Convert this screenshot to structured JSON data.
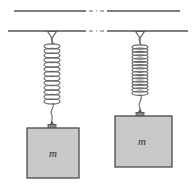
{
  "figure": {
    "background_color": "#ffffff",
    "line_color": "#555555",
    "block_fill_color": "#c9c9c9",
    "block_stroke_color": "#4a4a4a",
    "spring_color": "#666666",
    "ceiling": {
      "name": "ceiling-support",
      "upper_line_y": 11,
      "lower_line_y": 31,
      "break_gap_start_x": 86,
      "break_gap_end_x": 106,
      "break_style": "dash-dot"
    },
    "systems": [
      {
        "id": "left",
        "label": "m",
        "anchor_x": 52,
        "anchor_y": 31,
        "spring_top_y": 44,
        "spring_bottom_y": 104,
        "spring_coils": 13,
        "spring_state": "stretched",
        "block": {
          "x": 27,
          "y": 128,
          "width": 52,
          "height": 50
        }
      },
      {
        "id": "right",
        "label": "m",
        "anchor_x": 140,
        "anchor_y": 31,
        "spring_top_y": 44,
        "spring_bottom_y": 94,
        "spring_coils": 15,
        "spring_state": "compressed",
        "block": {
          "x": 115,
          "y": 116,
          "width": 57,
          "height": 51
        }
      }
    ]
  }
}
